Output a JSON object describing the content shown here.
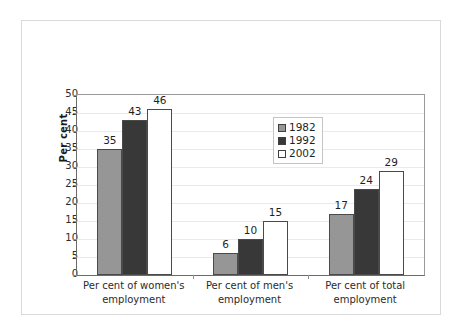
{
  "chart_data": {
    "type": "bar",
    "title": "",
    "subtitle": "",
    "xlabel": "",
    "ylabel": "Per cent",
    "ylim": [
      0,
      50
    ],
    "yticks": [
      0,
      5,
      10,
      15,
      20,
      25,
      30,
      35,
      40,
      45,
      50
    ],
    "grid": true,
    "legend_position": "inside-upper-right",
    "data_labels": true,
    "categories": [
      "Per cent of women's employment",
      "Per cent of men's employment",
      "Per cent of total employment"
    ],
    "category_lines": [
      [
        "Per cent of women's",
        "employment"
      ],
      [
        "Per cent of men's",
        "employment"
      ],
      [
        "Per cent of total",
        "employment"
      ]
    ],
    "series": [
      {
        "name": "1982",
        "color": "#969696",
        "values": [
          35,
          6,
          17
        ]
      },
      {
        "name": "1992",
        "color": "#383838",
        "values": [
          43,
          10,
          24
        ]
      },
      {
        "name": "2002",
        "color": "#ffffff",
        "values": [
          46,
          15,
          29
        ]
      }
    ]
  },
  "colors": {
    "series_1982": "#969696",
    "series_1992": "#383838",
    "series_2002": "#ffffff",
    "bar_outline": "#4a4a4a",
    "axis_line": "#6b6b6b",
    "gridline": "#eaeaea",
    "frame_border": "#d9d9d9",
    "text": "#1f1f1f"
  },
  "legend": {
    "items": [
      {
        "label": "1982"
      },
      {
        "label": "1992"
      },
      {
        "label": "2002"
      }
    ]
  }
}
